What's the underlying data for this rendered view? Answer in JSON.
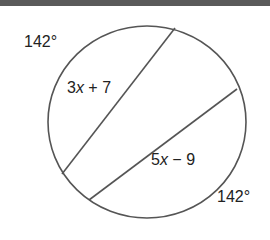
{
  "diagram": {
    "type": "circle-with-parallel-chords",
    "arc_labels": [
      {
        "id": "arc-top-left",
        "text": "142°"
      },
      {
        "id": "arc-bottom-right",
        "text": "142°"
      }
    ],
    "chord_labels": [
      {
        "id": "chord-1",
        "coef": "3",
        "var": "x",
        "rest": " + 7"
      },
      {
        "id": "chord-2",
        "coef": "5",
        "var": "x",
        "rest": " − 9"
      }
    ],
    "colors": {
      "stroke": "#555555",
      "text": "#222222",
      "topbar": "#5a5a5a"
    }
  }
}
